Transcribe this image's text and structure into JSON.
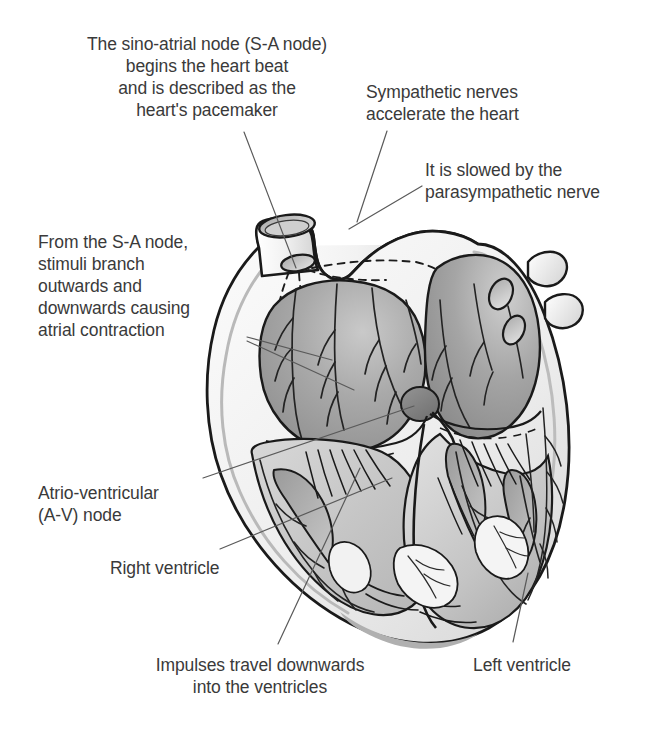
{
  "figure": {
    "background_color": "#ffffff",
    "text_color": "#3a3a3a",
    "line_color": "#555555"
  },
  "labels": [
    {
      "id": "sa-node",
      "name": "label-sino-atrial-node",
      "text": "The sino-atrial node (S-A node)\nbegins the heart beat\nand is described as the\nheart's pacemaker",
      "align": "center",
      "x": 52,
      "y": 33,
      "width": 310
    },
    {
      "id": "sympathetic",
      "name": "label-sympathetic-nerves",
      "text": "Sympathetic nerves\naccelerate the heart",
      "align": "left",
      "x": 366,
      "y": 81,
      "width": 200
    },
    {
      "id": "parasympathetic",
      "name": "label-parasympathetic-nerve",
      "text": "It is slowed by the\nparasympathetic nerve",
      "align": "left",
      "x": 425,
      "y": 159,
      "width": 225
    },
    {
      "id": "stimuli-branch",
      "name": "label-stimuli-branch",
      "text": "From the S-A node,\nstimuli branch\noutwards and\ndownwards causing\natrial contraction",
      "align": "left",
      "x": 38,
      "y": 231,
      "width": 215
    },
    {
      "id": "av-node",
      "name": "label-atrio-ventricular-node",
      "text": "Atrio-ventricular\n(A-V) node",
      "align": "left",
      "x": 38,
      "y": 482,
      "width": 180
    },
    {
      "id": "right-ventricle",
      "name": "label-right-ventricle",
      "text": "Right ventricle",
      "align": "left",
      "x": 110,
      "y": 557,
      "width": 150
    },
    {
      "id": "impulses",
      "name": "label-impulses-travel-downwards",
      "text": "Impulses travel downwards\ninto the ventricles",
      "align": "center",
      "x": 134,
      "y": 654,
      "width": 250
    },
    {
      "id": "left-ventricle",
      "name": "label-left-ventricle",
      "text": "Left ventricle",
      "align": "left",
      "x": 473,
      "y": 654,
      "width": 140
    }
  ],
  "leader_lines": [
    {
      "name": "leader-sa-node",
      "points": "244,132 296,268"
    },
    {
      "name": "leader-sympathetic",
      "points": "387,131 358,221"
    },
    {
      "name": "leader-parasympathetic",
      "points": "420,186 350,228"
    },
    {
      "name": "leader-stimuli-a",
      "points": "247,337 330,360"
    },
    {
      "name": "leader-stimuli-b",
      "points": "247,341 352,389"
    },
    {
      "name": "leader-av-node-1",
      "points": "203,478 414,406"
    },
    {
      "name": "leader-right-ventricle",
      "points": "220,549 390,478"
    },
    {
      "name": "leader-impulses",
      "points": "278,644 360,468"
    },
    {
      "name": "leader-left-ventricle",
      "points": "513,642 527,574"
    }
  ],
  "anatomy": {
    "structures": [
      {
        "name": "superior-vena-cava",
        "label": "Superior vena cava"
      },
      {
        "name": "sa-node-marker",
        "label": "S-A node"
      },
      {
        "name": "av-node-marker",
        "label": "A-V node"
      },
      {
        "name": "right-atrium",
        "label": "Right atrium"
      },
      {
        "name": "left-atrium",
        "label": "Left atrium"
      },
      {
        "name": "right-ventricle",
        "label": "Right ventricle"
      },
      {
        "name": "left-ventricle",
        "label": "Left ventricle"
      },
      {
        "name": "interventricular-septum",
        "label": "Septum"
      },
      {
        "name": "purkinje-fibres",
        "label": "Purkinje fibres"
      },
      {
        "name": "pulmonary-vein-stubs",
        "label": "Pulmonary veins"
      },
      {
        "name": "chordae-tendineae",
        "label": "Chordae tendineae"
      }
    ]
  }
}
